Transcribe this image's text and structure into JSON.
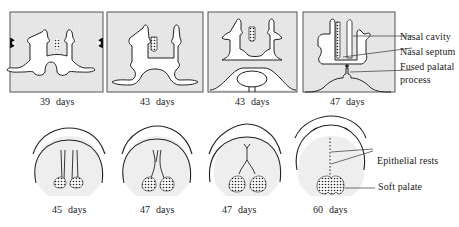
{
  "figure": {
    "top_row": {
      "panels": [
        {
          "id": "p39",
          "number": "39",
          "unit": "days"
        },
        {
          "id": "p43a",
          "number": "43",
          "unit": "days"
        },
        {
          "id": "p43b",
          "number": "43",
          "unit": "days"
        },
        {
          "id": "p47",
          "number": "47",
          "unit": "days"
        }
      ],
      "labels": {
        "nasal_cavity": "Nasal  cavity",
        "nasal_septum": "Nasal  septum",
        "fused_palatal_1": "Fused  palatal",
        "fused_palatal_2": "process"
      }
    },
    "bottom_row": {
      "panels": [
        {
          "id": "b45",
          "number": "45",
          "unit": "days"
        },
        {
          "id": "b47a",
          "number": "47",
          "unit": "days"
        },
        {
          "id": "b47b",
          "number": "47",
          "unit": "days"
        },
        {
          "id": "b60",
          "number": "60",
          "unit": "days"
        }
      ],
      "labels": {
        "epithelial_rests": "Epithelial  rests",
        "soft_palate": "Soft  palate"
      }
    },
    "colors": {
      "stipple_bg": "#e6e6e6",
      "line": "#222222",
      "fill_white": "#ffffff"
    }
  }
}
